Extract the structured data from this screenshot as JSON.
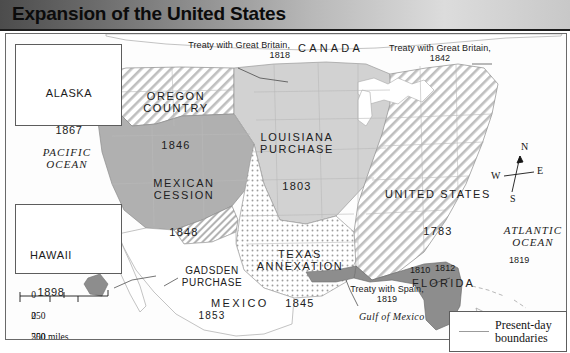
{
  "title": "Expansion of the United States",
  "territories": [
    {
      "name": "OREGON\nCOUNTRY",
      "year": "1846"
    },
    {
      "name": "LOUISIANA\nPURCHASE",
      "year": "1803"
    },
    {
      "name": "MEXICAN\nCESSION",
      "year": "1848"
    },
    {
      "name": "TEXAS\nANNEXATION",
      "year": "1845"
    },
    {
      "name": "GADSDEN\nPURCHASE",
      "year": "1853"
    },
    {
      "name": "UNITED STATES",
      "year": "1783"
    },
    {
      "name": "FLORIDA",
      "year": ""
    }
  ],
  "annotations": [
    {
      "text": "Treaty with Great Britain,\n1818"
    },
    {
      "text": "Treaty with Great Britain,\n1842"
    },
    {
      "text": "Treaty with Spain,\n1819"
    }
  ],
  "florida_dates": [
    "1810",
    "1812",
    "1819"
  ],
  "countries": [
    "CANADA",
    "MEXICO"
  ],
  "oceans": [
    "PACIFIC\nOCEAN",
    "ATLANTIC\nOCEAN"
  ],
  "gulf_label": "Gulf of Mexico",
  "insets": [
    {
      "name": "ALASKA",
      "year": "1867"
    },
    {
      "name": "HAWAII",
      "year": "1898"
    }
  ],
  "compass": {
    "n": "N",
    "e": "E",
    "s": "S",
    "w": "W"
  },
  "scale": {
    "miles_ticks": [
      "0",
      "250",
      "500 miles"
    ],
    "km_ticks": [
      "0",
      "250",
      "500 kilometers"
    ]
  },
  "legend": {
    "label": "Present-day\nboundaries"
  },
  "colors": {
    "title_dark": "#4c4c4c",
    "title_light": "#dcdcdc",
    "solid_mid_gray": "#b0b0b0",
    "solid_light_gray": "#d2d2d2",
    "florida_dark": "#8d8d8d",
    "border_line": "#9b9b9b"
  }
}
